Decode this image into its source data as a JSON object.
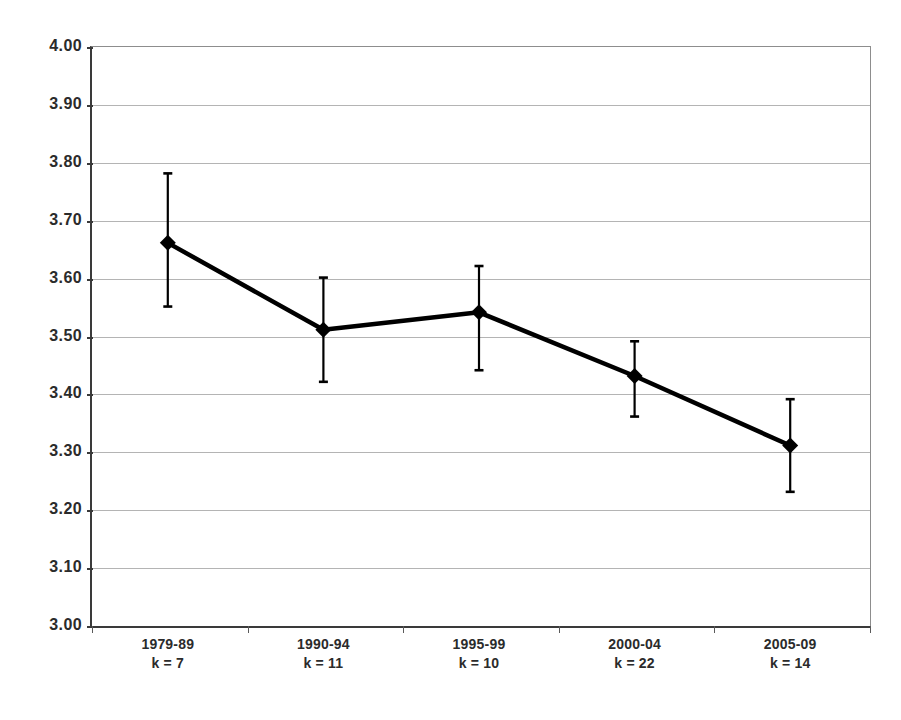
{
  "chart_data": {
    "type": "line",
    "title": "",
    "xlabel": "",
    "ylabel": "",
    "ylim": [
      3.0,
      4.0
    ],
    "ytick_step": 0.1,
    "grid": true,
    "legend": "none",
    "marker": "filled-diamond",
    "line_color": "#000000",
    "errorbar_color": "#000000",
    "gridline_color": "#b4b4b4",
    "axis_color": "#3a3a3a",
    "categories": [
      "1979-89",
      "1990-94",
      "1995-99",
      "2000-04",
      "2005-09"
    ],
    "k_labels": [
      "k = 7",
      "k = 11",
      "k = 10",
      "k = 22",
      "k = 14"
    ],
    "k_values": [
      7,
      11,
      10,
      22,
      14
    ],
    "values": [
      3.66,
      3.51,
      3.54,
      3.43,
      3.31
    ],
    "error_upper": [
      3.78,
      3.6,
      3.62,
      3.49,
      3.39
    ],
    "error_lower": [
      3.55,
      3.42,
      3.44,
      3.36,
      3.23
    ],
    "ytick_labels": [
      "4.00",
      "3.90",
      "3.80",
      "3.70",
      "3.60",
      "3.50",
      "3.40",
      "3.30",
      "3.20",
      "3.10",
      "3.00"
    ],
    "ytick_values": [
      4.0,
      3.9,
      3.8,
      3.7,
      3.6,
      3.5,
      3.4,
      3.3,
      3.2,
      3.1,
      3.0
    ],
    "points": [
      {
        "category": "1979-89",
        "k_label": "k = 7",
        "value": 3.66,
        "upper": 3.78,
        "lower": 3.55
      },
      {
        "category": "1990-94",
        "k_label": "k = 11",
        "value": 3.51,
        "upper": 3.6,
        "lower": 3.42
      },
      {
        "category": "1995-99",
        "k_label": "k = 10",
        "value": 3.54,
        "upper": 3.62,
        "lower": 3.44
      },
      {
        "category": "2000-04",
        "k_label": "k = 22",
        "value": 3.43,
        "upper": 3.49,
        "lower": 3.36
      },
      {
        "category": "2005-09",
        "k_label": "k = 14",
        "value": 3.31,
        "upper": 3.39,
        "lower": 3.23
      }
    ]
  }
}
